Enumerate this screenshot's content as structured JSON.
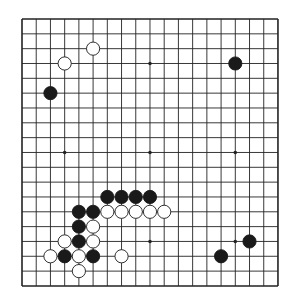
{
  "board": {
    "size": 19,
    "origin": {
      "x": 22,
      "y": 19
    },
    "spacing": {
      "x": 14.22,
      "y": 14.83
    },
    "line_color": "#222222",
    "background": "#ffffff",
    "star_points": [
      [
        3,
        9
      ],
      [
        9,
        9
      ],
      [
        15,
        9
      ],
      [
        9,
        3
      ],
      [
        9,
        15
      ],
      [
        15,
        15
      ]
    ],
    "stones": [
      {
        "color": "white",
        "col": 5,
        "row": 2
      },
      {
        "color": "white",
        "col": 3,
        "row": 3
      },
      {
        "color": "black",
        "col": 15,
        "row": 3
      },
      {
        "color": "black",
        "col": 2,
        "row": 5
      },
      {
        "color": "black",
        "col": 6,
        "row": 12
      },
      {
        "color": "black",
        "col": 7,
        "row": 12
      },
      {
        "color": "black",
        "col": 8,
        "row": 12
      },
      {
        "color": "black",
        "col": 9,
        "row": 12
      },
      {
        "color": "black",
        "col": 4,
        "row": 13
      },
      {
        "color": "black",
        "col": 5,
        "row": 13
      },
      {
        "color": "white",
        "col": 6,
        "row": 13
      },
      {
        "color": "white",
        "col": 7,
        "row": 13
      },
      {
        "color": "white",
        "col": 8,
        "row": 13
      },
      {
        "color": "white",
        "col": 9,
        "row": 13
      },
      {
        "color": "white",
        "col": 10,
        "row": 13
      },
      {
        "color": "black",
        "col": 4,
        "row": 14
      },
      {
        "color": "white",
        "col": 5,
        "row": 14
      },
      {
        "color": "white",
        "col": 3,
        "row": 15
      },
      {
        "color": "black",
        "col": 4,
        "row": 15
      },
      {
        "color": "white",
        "col": 5,
        "row": 15
      },
      {
        "color": "black",
        "col": 16,
        "row": 15
      },
      {
        "color": "white",
        "col": 2,
        "row": 16
      },
      {
        "color": "black",
        "col": 3,
        "row": 16
      },
      {
        "color": "white",
        "col": 4,
        "row": 16
      },
      {
        "color": "black",
        "col": 5,
        "row": 16
      },
      {
        "color": "white",
        "col": 7,
        "row": 16
      },
      {
        "color": "black",
        "col": 14,
        "row": 16
      },
      {
        "color": "white",
        "col": 4,
        "row": 17
      }
    ]
  }
}
